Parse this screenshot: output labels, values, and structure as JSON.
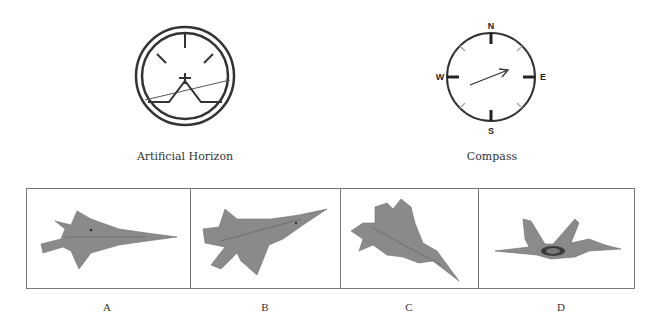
{
  "instruments": {
    "artificial_horizon": {
      "label": "Artificial Horizon",
      "icon": "artificial-horizon-icon",
      "horizon_tilt": "rising to the right"
    },
    "compass": {
      "label": "Compass",
      "icon": "compass-icon",
      "cardinals": {
        "north": "N",
        "east": "E",
        "south": "S",
        "west": "W"
      },
      "needle_heading": "east-northeast"
    }
  },
  "options": [
    {
      "letter": "A",
      "icon": "jet-aircraft-icon",
      "view": "top view, nose pointing right"
    },
    {
      "letter": "B",
      "icon": "jet-aircraft-icon",
      "view": "banked, nose pointing upper-right"
    },
    {
      "letter": "C",
      "icon": "jet-aircraft-icon",
      "view": "banked, nose pointing lower-right"
    },
    {
      "letter": "D",
      "icon": "jet-aircraft-icon",
      "view": "rear/side view, wings level"
    }
  ],
  "colors": {
    "ink": "#333333",
    "aircraft": "#8a8a8a",
    "frame": "#777777"
  }
}
